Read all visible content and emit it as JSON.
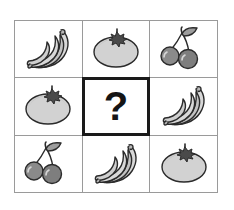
{
  "puzzle": {
    "type": "visual-analogy-matrix",
    "rows": 3,
    "columns": 3,
    "answer_cell_index": 4,
    "answer_placeholder": "?",
    "answer_cell_label": "missing-fruit",
    "colors": {
      "background": "#ffffff",
      "grid_line": "#9a9a9a",
      "answer_border": "#1a1a1a",
      "question_mark": "#151515",
      "banana_fill": "#d8d8d8",
      "banana_shade": "#b9b9b9",
      "tomato_fill": "#d2d2d2",
      "tomato_calyx": "#4a4a4a",
      "cherry_fill": "#8a8a8a",
      "cherry_shade": "#6f6f6f",
      "outline": "#2b2b2b"
    },
    "cells": [
      {
        "position": "top-left",
        "icon": "bananas-icon",
        "label": "bananas",
        "row": 1,
        "col": 1
      },
      {
        "position": "top-center",
        "icon": "tomato-icon",
        "label": "tomato",
        "row": 1,
        "col": 2
      },
      {
        "position": "top-right",
        "icon": "cherries-icon",
        "label": "cherries",
        "row": 1,
        "col": 3
      },
      {
        "position": "middle-left",
        "icon": "tomato-icon",
        "label": "tomato",
        "row": 2,
        "col": 1
      },
      {
        "position": "middle-center",
        "icon": "question-mark",
        "label": "?",
        "row": 2,
        "col": 2
      },
      {
        "position": "middle-right",
        "icon": "bananas-icon",
        "label": "bananas",
        "row": 2,
        "col": 3
      },
      {
        "position": "bottom-left",
        "icon": "cherries-icon",
        "label": "cherries",
        "row": 3,
        "col": 1
      },
      {
        "position": "bottom-center",
        "icon": "bananas-icon",
        "label": "bananas",
        "row": 3,
        "col": 2
      },
      {
        "position": "bottom-right",
        "icon": "tomato-icon",
        "label": "tomato",
        "row": 3,
        "col": 3
      }
    ]
  }
}
